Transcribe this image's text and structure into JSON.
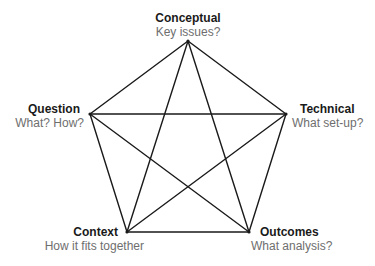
{
  "diagram": {
    "type": "pentagram",
    "line_color": "#1a1a1a",
    "title_color": "#1a1a1a",
    "subtitle_color": "#6e6e6e",
    "nodes": [
      {
        "id": "conceptual",
        "title": "Conceptual",
        "subtitle": "Key issues?",
        "x": 188,
        "y": 41
      },
      {
        "id": "technical",
        "title": "Technical",
        "subtitle": "What set-up?",
        "x": 286,
        "y": 114
      },
      {
        "id": "outcomes",
        "title": "Outcomes",
        "subtitle": "What analysis?",
        "x": 249,
        "y": 232
      },
      {
        "id": "context",
        "title": "Context",
        "subtitle": "How it fits together",
        "x": 127,
        "y": 232
      },
      {
        "id": "question",
        "title": "Question",
        "subtitle": "What? How?",
        "x": 90,
        "y": 114
      }
    ],
    "edges": [
      [
        "conceptual",
        "technical"
      ],
      [
        "technical",
        "outcomes"
      ],
      [
        "outcomes",
        "context"
      ],
      [
        "context",
        "question"
      ],
      [
        "question",
        "conceptual"
      ],
      [
        "conceptual",
        "outcomes"
      ],
      [
        "conceptual",
        "context"
      ],
      [
        "technical",
        "context"
      ],
      [
        "technical",
        "question"
      ],
      [
        "question",
        "outcomes"
      ]
    ]
  }
}
